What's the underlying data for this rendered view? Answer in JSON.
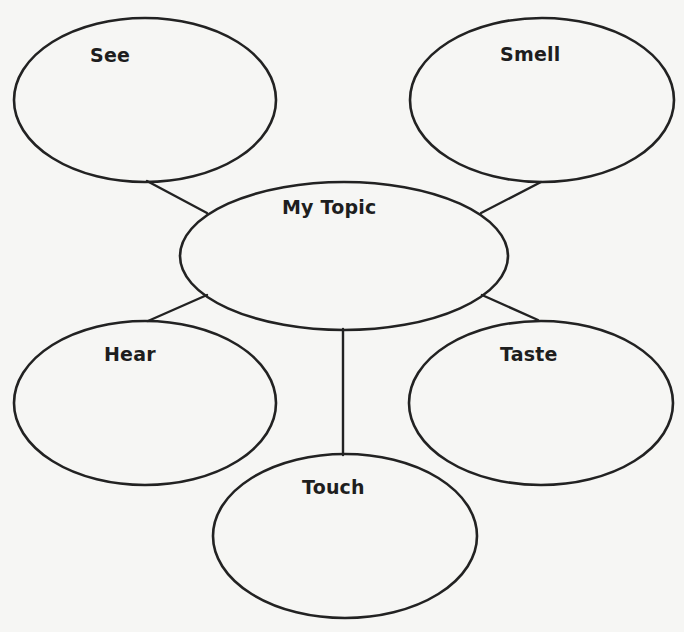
{
  "diagram": {
    "type": "web-organizer",
    "colors": {
      "background": "#f6f6f4",
      "stroke": "#222222",
      "text": "#1e1e1e"
    },
    "center": {
      "label": "My Topic",
      "cx": 344,
      "cy": 256,
      "rx": 164,
      "ry": 74,
      "label_x": 282,
      "label_y": 200
    },
    "bubbles": [
      {
        "id": "see",
        "label": "See",
        "cx": 145,
        "cy": 100,
        "rx": 131,
        "ry": 82,
        "label_x": 90,
        "label_y": 48
      },
      {
        "id": "smell",
        "label": "Smell",
        "cx": 542,
        "cy": 100,
        "rx": 132,
        "ry": 82,
        "label_x": 500,
        "label_y": 47
      },
      {
        "id": "hear",
        "label": "Hear",
        "cx": 145,
        "cy": 403,
        "rx": 131,
        "ry": 82,
        "label_x": 104,
        "label_y": 347
      },
      {
        "id": "taste",
        "label": "Taste",
        "cx": 541,
        "cy": 403,
        "rx": 132,
        "ry": 82,
        "label_x": 500,
        "label_y": 347
      },
      {
        "id": "touch",
        "label": "Touch",
        "cx": 345,
        "cy": 536,
        "rx": 132,
        "ry": 82,
        "label_x": 302,
        "label_y": 480
      }
    ],
    "connectors": [
      {
        "from": "see",
        "to": "center",
        "x1": 147,
        "y1": 181,
        "x2": 207,
        "y2": 213
      },
      {
        "from": "smell",
        "to": "center",
        "x1": 541,
        "y1": 182,
        "x2": 481,
        "y2": 213
      },
      {
        "from": "hear",
        "to": "center",
        "x1": 148,
        "y1": 321,
        "x2": 207,
        "y2": 295
      },
      {
        "from": "taste",
        "to": "center",
        "x1": 538,
        "y1": 320,
        "x2": 482,
        "y2": 295
      },
      {
        "from": "touch",
        "to": "center",
        "x1": 343,
        "y1": 455,
        "x2": 343,
        "y2": 329
      }
    ]
  }
}
